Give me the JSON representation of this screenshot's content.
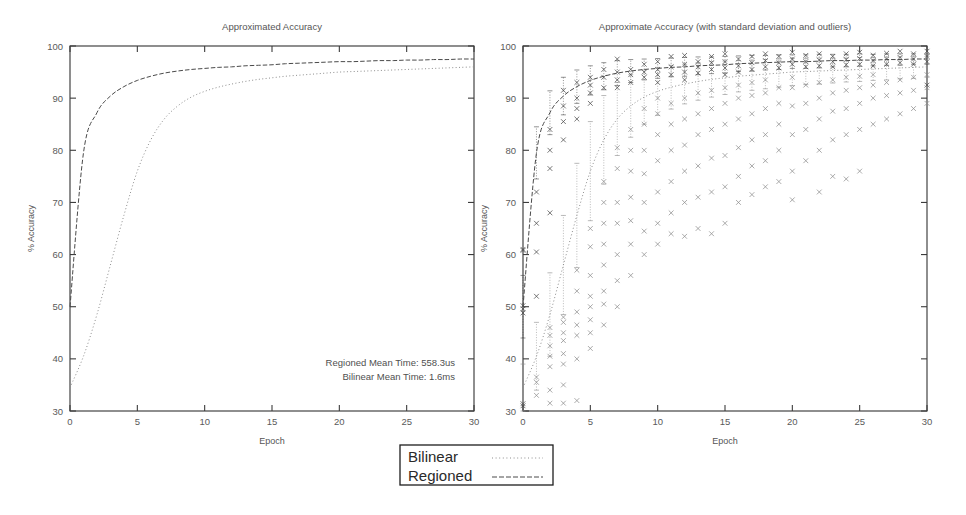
{
  "figure": {
    "width": 966,
    "height": 515,
    "background": "#ffffff"
  },
  "legend": {
    "name": "series-legend",
    "box": {
      "x": 400,
      "y": 445,
      "width": 153,
      "height": 40
    },
    "entries": [
      {
        "label": "Bilinear",
        "dash": "1,2.6",
        "color": "#8d8d8d",
        "width": 1.0
      },
      {
        "label": "Regioned",
        "dash": "5,2",
        "color": "#4a4a4a",
        "width": 1.0
      }
    ]
  },
  "panels": [
    {
      "name": "approximated-accuracy-plot",
      "title": "Approximated Accuracy",
      "frame": {
        "x": 70,
        "y": 46,
        "width": 404,
        "height": 365
      },
      "title_pos": {
        "x": 272,
        "y": 30
      },
      "annotations": [
        {
          "text": "Regioned Mean Time: 558.3us",
          "x": 455,
          "y": 366
        },
        {
          "text": "Bilinear Mean Time: 1.6ms",
          "x": 455,
          "y": 380
        }
      ],
      "show_outliers": false,
      "show_errorbars": false
    },
    {
      "name": "approximate-accuracy-stddev-plot",
      "title": "Approximate Accuracy (with standard deviation and outliers)",
      "frame": {
        "x": 523,
        "y": 46,
        "width": 404,
        "height": 365
      },
      "title_pos": {
        "x": 725,
        "y": 30
      },
      "annotations": [],
      "show_outliers": true,
      "show_errorbars": true
    }
  ],
  "chart_data": {
    "type": "line",
    "title": "Approximated Accuracy",
    "xlabel": "Epoch",
    "ylabel": "% Accuracy",
    "xlim": [
      0,
      30
    ],
    "ylim": [
      30,
      100
    ],
    "xticks": [
      0,
      5,
      10,
      15,
      20,
      25,
      30
    ],
    "yticks": [
      30,
      40,
      50,
      60,
      70,
      80,
      90,
      100
    ],
    "grid": false,
    "legend_position": "bottom-center",
    "x": [
      0,
      1,
      2,
      3,
      4,
      5,
      6,
      7,
      8,
      9,
      10,
      11,
      12,
      13,
      14,
      15,
      16,
      17,
      18,
      19,
      20,
      21,
      22,
      23,
      24,
      25,
      26,
      27,
      28,
      29,
      30
    ],
    "series": [
      {
        "name": "Regioned",
        "style": "dashed",
        "color": "#4a4a4a",
        "values": [
          50.0,
          79.5,
          87.2,
          90.4,
          92.2,
          93.4,
          94.2,
          94.8,
          95.2,
          95.5,
          95.7,
          95.9,
          96.0,
          96.2,
          96.3,
          96.4,
          96.6,
          96.7,
          96.8,
          96.9,
          97.0,
          97.0,
          97.1,
          97.2,
          97.2,
          97.3,
          97.3,
          97.4,
          97.4,
          97.5,
          97.5
        ],
        "stddev": [
          6.0,
          5.0,
          4.2,
          3.6,
          3.2,
          2.8,
          2.6,
          2.4,
          2.2,
          2.0,
          1.9,
          1.8,
          1.8,
          1.7,
          1.6,
          1.6,
          1.5,
          1.5,
          1.4,
          1.4,
          1.3,
          1.3,
          1.3,
          1.2,
          1.2,
          1.2,
          1.1,
          1.1,
          1.1,
          1.0,
          1.0
        ]
      },
      {
        "name": "Bilinear",
        "style": "dotted",
        "color": "#8d8d8d",
        "values": [
          34.5,
          40.5,
          48.5,
          58.0,
          67.5,
          76.0,
          82.0,
          86.0,
          88.5,
          90.2,
          91.3,
          92.1,
          92.7,
          93.2,
          93.6,
          93.9,
          94.2,
          94.4,
          94.6,
          94.8,
          95.0,
          95.1,
          95.2,
          95.3,
          95.4,
          95.5,
          95.6,
          95.7,
          95.8,
          95.9,
          96.0
        ],
        "stddev": [
          4.5,
          6.5,
          8.0,
          9.5,
          10.0,
          9.5,
          8.5,
          7.0,
          6.0,
          5.2,
          4.6,
          4.2,
          3.8,
          3.6,
          3.4,
          3.2,
          3.0,
          2.9,
          2.8,
          2.7,
          2.6,
          2.5,
          2.5,
          2.4,
          2.3,
          2.3,
          2.2,
          2.2,
          2.1,
          2.1,
          2.0
        ]
      }
    ],
    "outliers": {
      "Regioned": [
        [
          0,
          50.2
        ],
        [
          0,
          49.6
        ],
        [
          0,
          48.8
        ],
        [
          0,
          60.8
        ],
        [
          0,
          61.0
        ],
        [
          0,
          31.0
        ],
        [
          0,
          31.4
        ],
        [
          1,
          72.0
        ],
        [
          1,
          66.0
        ],
        [
          1,
          60.5
        ],
        [
          1,
          52.0
        ],
        [
          2,
          84.0
        ],
        [
          2,
          80.0
        ],
        [
          2,
          76.5
        ],
        [
          2,
          68.0
        ],
        [
          3,
          91.5
        ],
        [
          3,
          88.5
        ],
        [
          3,
          85.5
        ],
        [
          3,
          82.0
        ],
        [
          4,
          93.0
        ],
        [
          4,
          90.0
        ],
        [
          4,
          88.0
        ],
        [
          4,
          86.0
        ],
        [
          5,
          94.0
        ],
        [
          5,
          92.5
        ],
        [
          5,
          91.0
        ],
        [
          5,
          89.0
        ],
        [
          6,
          95.5
        ],
        [
          6,
          94.0
        ],
        [
          6,
          92.0
        ],
        [
          7,
          97.5
        ],
        [
          7,
          95.0
        ],
        [
          7,
          93.5
        ],
        [
          7,
          92.0
        ],
        [
          8,
          95.5
        ],
        [
          8,
          94.5
        ],
        [
          8,
          93.0
        ],
        [
          9,
          96.5
        ],
        [
          9,
          95.0
        ],
        [
          9,
          94.0
        ],
        [
          10,
          97.0
        ],
        [
          10,
          95.5
        ],
        [
          10,
          94.5
        ],
        [
          10,
          93.0
        ],
        [
          11,
          98.0
        ],
        [
          11,
          96.0
        ],
        [
          11,
          94.5
        ],
        [
          12,
          98.2
        ],
        [
          12,
          96.5
        ],
        [
          12,
          95.0
        ],
        [
          12,
          93.5
        ],
        [
          13,
          97.0
        ],
        [
          13,
          96.0
        ],
        [
          13,
          94.8
        ],
        [
          14,
          98.0
        ],
        [
          14,
          96.8
        ],
        [
          14,
          95.5
        ],
        [
          15,
          98.5
        ],
        [
          15,
          97.0
        ],
        [
          15,
          95.8
        ],
        [
          15,
          94.5
        ],
        [
          16,
          97.5
        ],
        [
          16,
          96.2
        ],
        [
          16,
          95.0
        ],
        [
          17,
          98.0
        ],
        [
          17,
          96.8
        ],
        [
          17,
          95.5
        ],
        [
          18,
          98.5
        ],
        [
          18,
          97.2
        ],
        [
          18,
          96.0
        ],
        [
          19,
          98.0
        ],
        [
          19,
          96.8
        ],
        [
          19,
          95.8
        ],
        [
          20,
          98.8
        ],
        [
          20,
          97.5
        ],
        [
          20,
          96.5
        ],
        [
          21,
          98.2
        ],
        [
          21,
          97.0
        ],
        [
          21,
          96.0
        ],
        [
          22,
          98.5
        ],
        [
          22,
          97.3
        ],
        [
          22,
          96.2
        ],
        [
          23,
          98.0
        ],
        [
          23,
          97.0
        ],
        [
          23,
          96.0
        ],
        [
          24,
          98.5
        ],
        [
          24,
          97.4
        ],
        [
          24,
          96.4
        ],
        [
          25,
          98.8
        ],
        [
          25,
          97.6
        ],
        [
          25,
          96.5
        ],
        [
          26,
          98.2
        ],
        [
          26,
          97.2
        ],
        [
          26,
          96.2
        ],
        [
          27,
          98.6
        ],
        [
          27,
          97.5
        ],
        [
          27,
          96.5
        ],
        [
          28,
          99.0
        ],
        [
          28,
          97.8
        ],
        [
          28,
          96.8
        ],
        [
          29,
          98.5
        ],
        [
          29,
          97.5
        ],
        [
          29,
          96.5
        ],
        [
          30,
          99.0
        ],
        [
          30,
          98.0
        ],
        [
          30,
          97.0
        ],
        [
          30,
          92.5
        ]
      ],
      "Bilinear": [
        [
          1,
          33.0
        ],
        [
          1,
          35.5
        ],
        [
          1,
          36.5
        ],
        [
          2,
          31.5
        ],
        [
          2,
          34.0
        ],
        [
          2,
          38.5
        ],
        [
          2,
          40.5
        ],
        [
          2,
          42.5
        ],
        [
          2,
          44.5
        ],
        [
          2,
          46.0
        ],
        [
          3,
          31.5
        ],
        [
          3,
          35.0
        ],
        [
          3,
          39.0
        ],
        [
          3,
          41.0
        ],
        [
          3,
          43.5
        ],
        [
          3,
          45.0
        ],
        [
          3,
          47.0
        ],
        [
          3,
          48.0
        ],
        [
          4,
          32.0
        ],
        [
          4,
          40.0
        ],
        [
          4,
          44.5
        ],
        [
          4,
          46.5
        ],
        [
          4,
          49.0
        ],
        [
          4,
          53.0
        ],
        [
          4,
          57.0
        ],
        [
          5,
          42.0
        ],
        [
          5,
          45.0
        ],
        [
          5,
          47.5
        ],
        [
          5,
          50.0
        ],
        [
          5,
          52.0
        ],
        [
          5,
          56.0
        ],
        [
          5,
          61.5
        ],
        [
          5,
          65.0
        ],
        [
          6,
          46.5
        ],
        [
          6,
          50.5
        ],
        [
          6,
          53.0
        ],
        [
          6,
          58.0
        ],
        [
          6,
          62.0
        ],
        [
          6,
          66.0
        ],
        [
          6,
          70.0
        ],
        [
          6,
          74.0
        ],
        [
          7,
          50.0
        ],
        [
          7,
          55.0
        ],
        [
          7,
          60.0
        ],
        [
          7,
          66.0
        ],
        [
          7,
          70.0
        ],
        [
          7,
          76.5
        ],
        [
          7,
          80.5
        ],
        [
          8,
          56.0
        ],
        [
          8,
          62.0
        ],
        [
          8,
          66.5
        ],
        [
          8,
          71.0
        ],
        [
          8,
          76.0
        ],
        [
          8,
          80.0
        ],
        [
          8,
          84.0
        ],
        [
          9,
          60.0
        ],
        [
          9,
          64.5
        ],
        [
          9,
          70.0
        ],
        [
          9,
          75.5
        ],
        [
          9,
          80.0
        ],
        [
          9,
          85.0
        ],
        [
          9,
          88.0
        ],
        [
          10,
          62.0
        ],
        [
          10,
          66.0
        ],
        [
          10,
          72.0
        ],
        [
          10,
          78.0
        ],
        [
          10,
          83.0
        ],
        [
          10,
          87.0
        ],
        [
          10,
          90.0
        ],
        [
          11,
          64.0
        ],
        [
          11,
          68.0
        ],
        [
          11,
          74.0
        ],
        [
          11,
          80.0
        ],
        [
          11,
          85.0
        ],
        [
          11,
          89.0
        ],
        [
          12,
          63.5
        ],
        [
          12,
          70.0
        ],
        [
          12,
          76.0
        ],
        [
          12,
          81.0
        ],
        [
          12,
          86.0
        ],
        [
          12,
          90.0
        ],
        [
          13,
          65.0
        ],
        [
          13,
          71.0
        ],
        [
          13,
          77.0
        ],
        [
          13,
          83.0
        ],
        [
          13,
          87.0
        ],
        [
          13,
          91.0
        ],
        [
          14,
          64.0
        ],
        [
          14,
          72.0
        ],
        [
          14,
          78.5
        ],
        [
          14,
          84.0
        ],
        [
          14,
          88.0
        ],
        [
          14,
          91.5
        ],
        [
          15,
          66.0
        ],
        [
          15,
          73.0
        ],
        [
          15,
          79.0
        ],
        [
          15,
          85.0
        ],
        [
          15,
          89.0
        ],
        [
          15,
          92.0
        ],
        [
          16,
          70.0
        ],
        [
          16,
          75.0
        ],
        [
          16,
          80.5
        ],
        [
          16,
          86.0
        ],
        [
          16,
          90.0
        ],
        [
          16,
          92.5
        ],
        [
          17,
          71.5
        ],
        [
          17,
          77.0
        ],
        [
          17,
          82.0
        ],
        [
          17,
          87.0
        ],
        [
          17,
          90.5
        ],
        [
          17,
          93.0
        ],
        [
          18,
          73.0
        ],
        [
          18,
          78.0
        ],
        [
          18,
          83.0
        ],
        [
          18,
          88.0
        ],
        [
          18,
          91.0
        ],
        [
          18,
          93.5
        ],
        [
          19,
          74.0
        ],
        [
          19,
          80.0
        ],
        [
          19,
          85.0
        ],
        [
          19,
          89.0
        ],
        [
          19,
          92.0
        ],
        [
          20,
          70.5
        ],
        [
          20,
          76.0
        ],
        [
          20,
          83.0
        ],
        [
          20,
          88.5
        ],
        [
          20,
          92.0
        ],
        [
          20,
          94.0
        ],
        [
          21,
          78.0
        ],
        [
          21,
          84.0
        ],
        [
          21,
          89.0
        ],
        [
          21,
          92.5
        ],
        [
          22,
          72.0
        ],
        [
          22,
          80.0
        ],
        [
          22,
          86.0
        ],
        [
          22,
          90.0
        ],
        [
          22,
          93.0
        ],
        [
          23,
          75.0
        ],
        [
          23,
          82.0
        ],
        [
          23,
          87.5
        ],
        [
          23,
          91.0
        ],
        [
          23,
          93.5
        ],
        [
          24,
          74.5
        ],
        [
          24,
          83.0
        ],
        [
          24,
          88.0
        ],
        [
          24,
          91.5
        ],
        [
          24,
          94.0
        ],
        [
          25,
          76.0
        ],
        [
          25,
          84.0
        ],
        [
          25,
          89.0
        ],
        [
          25,
          92.0
        ],
        [
          25,
          94.2
        ],
        [
          26,
          85.0
        ],
        [
          26,
          90.0
        ],
        [
          26,
          92.5
        ],
        [
          26,
          94.5
        ],
        [
          27,
          86.0
        ],
        [
          27,
          90.5
        ],
        [
          27,
          93.0
        ],
        [
          28,
          87.0
        ],
        [
          28,
          91.0
        ],
        [
          28,
          93.5
        ],
        [
          29,
          88.0
        ],
        [
          29,
          91.5
        ],
        [
          29,
          94.0
        ],
        [
          30,
          89.0
        ],
        [
          30,
          92.0
        ],
        [
          30,
          94.5
        ]
      ]
    }
  }
}
